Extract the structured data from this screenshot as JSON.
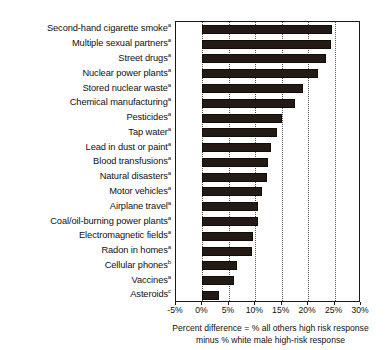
{
  "chart_data": {
    "type": "bar",
    "orientation": "horizontal",
    "title": "",
    "xlabel": "Percent difference = % all others high risk response minus % white male high-risk response",
    "ylabel": "",
    "xlim": [
      -5,
      30
    ],
    "xticks": [
      -5,
      0,
      5,
      10,
      15,
      20,
      25,
      30
    ],
    "xtick_labels": [
      "-5%",
      "0%",
      "5%",
      "10%",
      "15%",
      "20%",
      "25%",
      "30%"
    ],
    "grid": true,
    "grid_style": "dotted vertical",
    "legend": "none",
    "bar_color": "#231a16",
    "categories": [
      "Second-hand cigarette smoke",
      "Multiple sexual partners",
      "Street drugs",
      "Nuclear power plants",
      "Stored nuclear waste",
      "Chemical manufacturing",
      "Pesticides",
      "Tap water",
      "Lead in dust or paint",
      "Blood transfusions",
      "Natural disasters",
      "Motor vehicles",
      "Airplane travel",
      "Coal/oil-burning power plants",
      "Electromagnetic fields",
      "Radon in homes",
      "Cellular phones",
      "Vaccines",
      "Asteroids"
    ],
    "footnote_marks": [
      "a",
      "a",
      "a",
      "a",
      "a",
      "a",
      "a",
      "a",
      "a",
      "a",
      "a",
      "a",
      "a",
      "a",
      "a",
      "a",
      "b",
      "a",
      "c"
    ],
    "values": [
      24.5,
      24.4,
      23.3,
      21.9,
      19.1,
      17.6,
      15.0,
      14.1,
      12.9,
      12.5,
      12.3,
      11.3,
      10.6,
      10.6,
      9.5,
      9.3,
      6.5,
      5.9,
      3.2
    ]
  },
  "axis": {
    "caption_line1": "Percent difference = % all others high risk response",
    "caption_line2": "minus % white male high-risk response"
  }
}
